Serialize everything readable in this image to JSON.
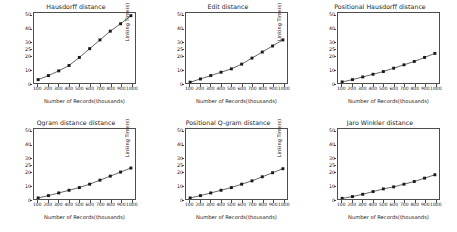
{
  "figure": {
    "background": "#ffffff",
    "line_color": "#3d3d3d",
    "marker_color": "#1a1a1a",
    "axis_color": "#4d4d4d",
    "rows": 2,
    "cols": 3
  },
  "chart_data": [
    {
      "type": "line",
      "title": "Hausdorff distance",
      "xlabel": "Number of Records(thousands)",
      "ylabel": "Linking Time(s)",
      "x": [
        100,
        200,
        300,
        400,
        500,
        600,
        700,
        800,
        900,
        1000
      ],
      "values": [
        2.5,
        5.5,
        9.0,
        13.0,
        19.0,
        25.5,
        32.0,
        38.5,
        44.0,
        50.0
      ],
      "xtick_labels": [
        "100",
        "200",
        "300",
        "400",
        "500",
        "600",
        "700",
        "800",
        "900",
        "1000"
      ],
      "ytick_labels": [
        "0",
        "10",
        "20",
        "25",
        "30",
        "40",
        "50"
      ],
      "ytick_values": [
        0,
        10,
        20,
        25,
        30,
        40,
        50
      ],
      "ylim": [
        0,
        52
      ],
      "xlim": [
        60,
        1040
      ],
      "grid": false,
      "legend": "none",
      "marker": "square"
    },
    {
      "type": "line",
      "title": "Edit distance",
      "xlabel": "Number of Records(thousands)",
      "ylabel": "Linking Time(s)",
      "x": [
        100,
        200,
        300,
        400,
        500,
        600,
        700,
        800,
        900,
        1000
      ],
      "values": [
        0.6,
        3.0,
        5.5,
        8.0,
        10.5,
        14.0,
        18.5,
        23.0,
        27.5,
        32.0
      ],
      "xtick_labels": [
        "100",
        "200",
        "300",
        "400",
        "500",
        "600",
        "700",
        "800",
        "900",
        "1000"
      ],
      "ytick_labels": [
        "0",
        "10",
        "20",
        "25",
        "30",
        "40",
        "50"
      ],
      "ytick_values": [
        0,
        10,
        20,
        25,
        30,
        40,
        50
      ],
      "ylim": [
        0,
        52
      ],
      "xlim": [
        60,
        1040
      ],
      "grid": false,
      "legend": "none",
      "marker": "square"
    },
    {
      "type": "line",
      "title": "Positional Hausdorff distance",
      "xlabel": "Number of Records(thousands)",
      "ylabel": "Linking Time(s)",
      "x": [
        100,
        200,
        300,
        400,
        500,
        600,
        700,
        800,
        900,
        1000
      ],
      "values": [
        0.8,
        2.5,
        4.5,
        6.5,
        8.5,
        11.0,
        13.5,
        16.0,
        19.0,
        22.0
      ],
      "xtick_labels": [
        "100",
        "200",
        "300",
        "400",
        "500",
        "600",
        "700",
        "800",
        "900",
        "1000"
      ],
      "ytick_labels": [
        "0",
        "10",
        "20",
        "25",
        "30",
        "40",
        "50"
      ],
      "ytick_values": [
        0,
        10,
        20,
        25,
        30,
        40,
        50
      ],
      "ylim": [
        0,
        52
      ],
      "xlim": [
        60,
        1040
      ],
      "grid": false,
      "legend": "none",
      "marker": "square"
    },
    {
      "type": "line",
      "title": "Qgram distance distance",
      "xlabel": "Number of Records(thousands)",
      "ylabel": "Linking Time(s)",
      "x": [
        100,
        200,
        300,
        400,
        500,
        600,
        700,
        800,
        900,
        1000
      ],
      "values": [
        0.8,
        2.5,
        4.5,
        6.5,
        8.5,
        11.0,
        14.0,
        17.0,
        20.0,
        23.0
      ],
      "xtick_labels": [
        "100",
        "200",
        "300",
        "400",
        "500",
        "600",
        "700",
        "800",
        "900",
        "1000"
      ],
      "ytick_labels": [
        "0",
        "10",
        "20",
        "25",
        "30",
        "40",
        "50"
      ],
      "ytick_values": [
        0,
        10,
        20,
        25,
        30,
        40,
        50
      ],
      "ylim": [
        0,
        52
      ],
      "xlim": [
        60,
        1040
      ],
      "grid": false,
      "legend": "none",
      "marker": "square"
    },
    {
      "type": "line",
      "title": "Positional Q-gram distance",
      "xlabel": "Number of Records(thousands)",
      "ylabel": "Linking Time(s)",
      "x": [
        100,
        200,
        300,
        400,
        500,
        600,
        700,
        800,
        900,
        1000
      ],
      "values": [
        0.8,
        2.5,
        4.5,
        6.5,
        8.5,
        11.0,
        13.5,
        16.5,
        19.5,
        22.5
      ],
      "xtick_labels": [
        "100",
        "200",
        "300",
        "400",
        "500",
        "600",
        "700",
        "800",
        "900",
        "1000"
      ],
      "ytick_labels": [
        "0",
        "10",
        "20",
        "25",
        "30",
        "40",
        "50"
      ],
      "ytick_values": [
        0,
        10,
        20,
        25,
        30,
        40,
        50
      ],
      "ylim": [
        0,
        52
      ],
      "xlim": [
        60,
        1040
      ],
      "grid": false,
      "legend": "none",
      "marker": "square"
    },
    {
      "type": "line",
      "title": "Jaro Winkler distance",
      "xlabel": "Number of Records(thousands)",
      "ylabel": "Linking Time(s)",
      "x": [
        100,
        200,
        300,
        400,
        500,
        600,
        700,
        800,
        900,
        1000
      ],
      "values": [
        0.5,
        1.8,
        3.5,
        5.5,
        7.5,
        9.0,
        11.0,
        13.0,
        15.5,
        18.0
      ],
      "xtick_labels": [
        "100",
        "200",
        "300",
        "400",
        "500",
        "600",
        "700",
        "800",
        "900",
        "1000"
      ],
      "ytick_labels": [
        "0",
        "10",
        "20",
        "25",
        "30",
        "40",
        "50"
      ],
      "ytick_values": [
        0,
        10,
        20,
        25,
        30,
        40,
        50
      ],
      "ylim": [
        0,
        52
      ],
      "xlim": [
        60,
        1040
      ],
      "grid": false,
      "legend": "none",
      "marker": "square"
    }
  ]
}
